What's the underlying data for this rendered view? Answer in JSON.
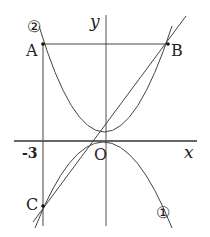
{
  "labels": {
    "y_axis": "y",
    "x_axis": "x",
    "origin": "O",
    "point_a": "A",
    "point_b": "B",
    "point_c": "C",
    "tick_neg3": "-3",
    "curve1": "①",
    "curve2": "②"
  },
  "colors": {
    "stroke": "#333333",
    "background": "#ffffff"
  }
}
